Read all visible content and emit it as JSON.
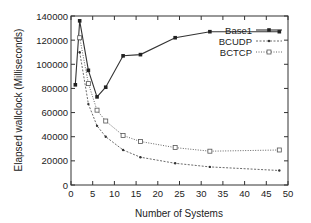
{
  "chart_data": {
    "type": "line",
    "title": "",
    "xlabel": "Number of Systems",
    "ylabel": "Elapsed wallclock (Milliseconds)",
    "xlim": [
      0,
      50
    ],
    "ylim": [
      0,
      140000
    ],
    "xticks": [
      0,
      5,
      10,
      15,
      20,
      25,
      30,
      35,
      40,
      45,
      50
    ],
    "yticks": [
      0,
      20000,
      40000,
      60000,
      80000,
      100000,
      120000,
      140000
    ],
    "grid": false,
    "legend_position": "top-right",
    "series": [
      {
        "name": "Base1",
        "marker": "filled-square",
        "line": "solid",
        "x": [
          1,
          2,
          4,
          6,
          8,
          12,
          16,
          24,
          32,
          48
        ],
        "y": [
          83000,
          136000,
          95000,
          73000,
          81000,
          107000,
          108000,
          122000,
          127000,
          127000
        ]
      },
      {
        "name": "BCUDP",
        "marker": "dot",
        "line": "dashed",
        "x": [
          2,
          4,
          6,
          8,
          12,
          16,
          24,
          32,
          48
        ],
        "y": [
          110000,
          67000,
          49000,
          40000,
          29000,
          23000,
          18000,
          15000,
          12000
        ]
      },
      {
        "name": "BCTCP",
        "marker": "open-square",
        "line": "dotted",
        "x": [
          2,
          4,
          6,
          8,
          12,
          16,
          24,
          32,
          48
        ],
        "y": [
          122000,
          84000,
          62000,
          53000,
          41000,
          36000,
          31000,
          28000,
          29000
        ]
      }
    ]
  }
}
